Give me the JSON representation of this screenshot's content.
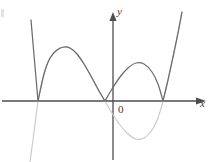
{
  "figure": {
    "name": "absolute-value-cubic-graph",
    "width": 209,
    "height": 162,
    "background": "#ffffff"
  },
  "labels": {
    "y_axis": "y",
    "x_axis": "x",
    "origin": "0"
  },
  "colors": {
    "axis": "#4d4d4d",
    "curve_primary": "#6b6b6b",
    "curve_secondary": "#c8c8c8",
    "text": "#3c3c3c"
  },
  "chart_data": {
    "type": "line",
    "title": "",
    "xlabel": "x",
    "ylabel": "y",
    "grid": false,
    "legend": null,
    "axes": {
      "x_axis_pixel_y": 101,
      "y_axis_pixel_x": 113,
      "x_arrow": true,
      "y_arrow": true,
      "tick_labels": [
        "0"
      ]
    },
    "annotations": [
      {
        "text": "0",
        "x": 118,
        "y": 104
      },
      {
        "text": "y",
        "x": 117,
        "y": 6
      },
      {
        "text": "x",
        "x": 200,
        "y": 98
      }
    ],
    "series": [
      {
        "name": "f(x) (faint gray cubic)",
        "color": "#c8c8c8",
        "style": "solid",
        "roots_pixel_x": [
          38,
          105,
          163
        ],
        "points": [
          [
            30,
            162
          ],
          [
            34,
            132
          ],
          [
            38,
            101
          ],
          [
            44,
            74
          ],
          [
            50,
            58
          ],
          [
            57,
            50
          ],
          [
            64,
            47
          ],
          [
            70,
            48
          ],
          [
            77,
            54
          ],
          [
            84,
            64
          ],
          [
            92,
            78
          ],
          [
            99,
            91
          ],
          [
            105,
            101
          ],
          [
            112,
            113
          ],
          [
            120,
            125
          ],
          [
            128,
            134
          ],
          [
            136,
            139
          ],
          [
            144,
            138
          ],
          [
            152,
            130
          ],
          [
            158,
            118
          ],
          [
            163,
            101
          ],
          [
            168,
            80
          ],
          [
            173,
            57
          ],
          [
            178,
            33
          ],
          [
            182,
            12
          ]
        ]
      },
      {
        "name": "|f(x)| (dark gray, negative part reflected)",
        "color": "#6b6b6b",
        "style": "solid",
        "cusps_pixel_x": [
          38,
          105,
          163
        ],
        "points": [
          [
            31,
            20
          ],
          [
            34,
            55
          ],
          [
            38,
            101
          ],
          [
            44,
            74
          ],
          [
            50,
            58
          ],
          [
            57,
            50
          ],
          [
            64,
            47
          ],
          [
            70,
            48
          ],
          [
            77,
            54
          ],
          [
            84,
            64
          ],
          [
            92,
            78
          ],
          [
            99,
            91
          ],
          [
            105,
            101
          ],
          [
            112,
            89
          ],
          [
            120,
            77
          ],
          [
            128,
            68
          ],
          [
            136,
            63
          ],
          [
            144,
            64
          ],
          [
            152,
            72
          ],
          [
            158,
            84
          ],
          [
            163,
            101
          ],
          [
            168,
            80
          ],
          [
            173,
            57
          ],
          [
            178,
            33
          ],
          [
            182,
            12
          ]
        ]
      }
    ]
  }
}
